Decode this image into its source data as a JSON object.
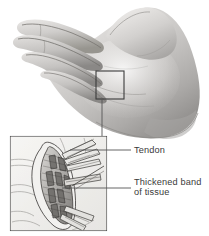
{
  "figure": {
    "background_color": "#ffffff"
  },
  "photo": {
    "name": "cupped-hand-photograph",
    "description": "Grayscale photograph of a cupped left hand, palm facing up and to the left, fingers extended toward upper left",
    "skin_color_light": "#e0dedc",
    "skin_color_mid": "#c3c1bf",
    "skin_color_shadow": "#8e8c8a",
    "skin_color_dark": "#5d5b59"
  },
  "callout": {
    "name": "callout-box",
    "description": "Rectangle on palm marking the region magnified in the inset",
    "stroke_color": "#3b3b3b",
    "x": 96,
    "y": 71,
    "width": 28,
    "height": 28
  },
  "inset": {
    "name": "anatomy-inset-panel",
    "description": "Line-drawing magnification of the palm showing the flexor tendon and thickened fascial band",
    "frame_color": "#2e2e2e",
    "fill_color": "#f4f4f2",
    "x": 10,
    "y": 136,
    "width": 97,
    "height": 95
  },
  "labels": [
    {
      "id": "tendon",
      "name": "label-tendon",
      "lines": [
        "Tendon"
      ],
      "text_x": 133,
      "text_y": 153,
      "leader": {
        "x1": 122,
        "y1": 150,
        "x2": 70,
        "y2": 150
      }
    },
    {
      "id": "thickened-band",
      "name": "label-thickened-band-of-tissue",
      "lines": [
        "Thickened band",
        "of tissue"
      ],
      "text_x": 133,
      "text_y": 187,
      "leader": {
        "x1": 122,
        "y1": 188,
        "x2": 62,
        "y2": 188
      }
    }
  ],
  "connector": {
    "name": "callout-to-inset-connector",
    "description": "Vertical leader line linking the callout box on the palm to the inset panel",
    "x1": 102,
    "y1": 99,
    "x2": 102,
    "y2": 136
  },
  "colors": {
    "text": "#3a3a3a",
    "leader": "#555555",
    "frame": "#2e2e2e",
    "background": "#ffffff"
  }
}
